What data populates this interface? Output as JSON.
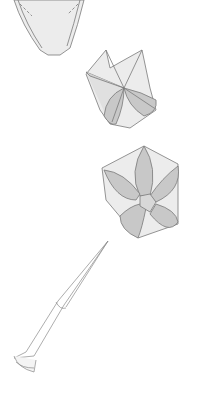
{
  "diagram": {
    "type": "origami-instruction-figure",
    "steps": [
      {
        "name": "folded-petal-unit",
        "description": "folded cone/petal base (partially cropped at top)"
      },
      {
        "name": "opened-flower-3d",
        "description": "flower opened into five-petal 3D shape, side view"
      },
      {
        "name": "finished-flower-top",
        "description": "finished five-petal flower, top view"
      },
      {
        "name": "stem",
        "description": "rolled paper stem attached to flower"
      }
    ],
    "colors": {
      "line": "#7a7a7a",
      "light_fill": "#ececec",
      "petal_fill": "#c8c8c8",
      "background": "#ffffff"
    },
    "caption": ""
  }
}
